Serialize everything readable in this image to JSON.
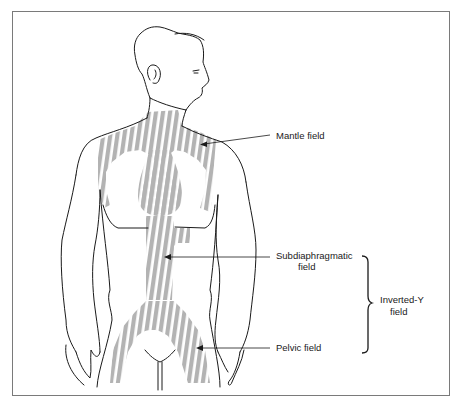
{
  "diagram": {
    "colors": {
      "stripe": "#b3b3b3",
      "outline": "#1a1a1a",
      "frame": "#7a7a7a",
      "background": "#ffffff"
    },
    "labels": {
      "mantle": "Mantle field",
      "subdiaphragmatic_line1": "Subdiaphragmatic",
      "subdiaphragmatic_line2": "field",
      "pelvic": "Pelvic field",
      "inverted_y_line1": "Inverted-Y",
      "inverted_y_line2": "field"
    }
  }
}
